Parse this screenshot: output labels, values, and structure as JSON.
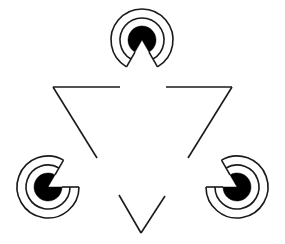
{
  "canvas": {
    "width": 285,
    "height": 244,
    "background_color": "#ffffff",
    "stroke_color": "#1a1a1a",
    "fill_color": "#000000",
    "figure_name": "kanizsa-illusory-triangle"
  },
  "triangle": {
    "orientation": "inverted",
    "stroke_width": 1.6,
    "vertices": [
      {
        "name": "top-left",
        "x": 53,
        "y": 87
      },
      {
        "name": "top-right",
        "x": 232,
        "y": 87
      },
      {
        "name": "bottom",
        "x": 141,
        "y": 233
      }
    ],
    "segments": [
      {
        "name": "top-edge-left",
        "x1": 53,
        "y1": 87,
        "x2": 120,
        "y2": 87
      },
      {
        "name": "top-edge-right",
        "x1": 166,
        "y1": 87,
        "x2": 232,
        "y2": 87
      },
      {
        "name": "left-edge-upper",
        "x1": 53,
        "y1": 87,
        "x2": 97,
        "y2": 158
      },
      {
        "name": "left-edge-lower",
        "x1": 119,
        "y1": 195,
        "x2": 141,
        "y2": 233
      },
      {
        "name": "right-edge-upper",
        "x1": 232,
        "y1": 87,
        "x2": 188,
        "y2": 158
      },
      {
        "name": "right-edge-lower",
        "x1": 165,
        "y1": 196,
        "x2": 141,
        "y2": 233
      }
    ]
  },
  "inducers": [
    {
      "name": "inducer-top",
      "position": "top",
      "center_x": 142,
      "center_y": 40,
      "disk_radius": 14,
      "rings": [
        {
          "name": "ring-inner",
          "radius": 22
        },
        {
          "name": "ring-outer",
          "radius": 31
        }
      ],
      "wedge_start_deg": 60,
      "wedge_end_deg": 120,
      "wedge_points_toward": "triangle-center"
    },
    {
      "name": "inducer-bottom-left",
      "position": "bottom-left",
      "center_x": 48,
      "center_y": 187,
      "disk_radius": 14,
      "rings": [
        {
          "name": "ring-inner",
          "radius": 22
        },
        {
          "name": "ring-outer",
          "radius": 31
        }
      ],
      "wedge_start_deg": -60,
      "wedge_end_deg": 0,
      "wedge_points_toward": "triangle-center"
    },
    {
      "name": "inducer-bottom-right",
      "position": "bottom-right",
      "center_x": 237,
      "center_y": 187,
      "disk_radius": 14,
      "rings": [
        {
          "name": "ring-inner",
          "radius": 22
        },
        {
          "name": "ring-outer",
          "radius": 31
        }
      ],
      "wedge_start_deg": 180,
      "wedge_end_deg": 240,
      "wedge_points_toward": "triangle-center"
    }
  ]
}
